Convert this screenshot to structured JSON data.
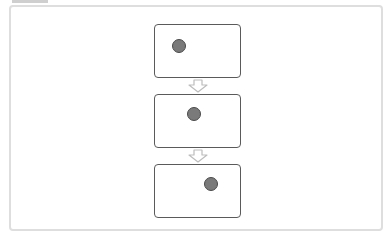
{
  "diagram": {
    "colors": {
      "frame_border": "#dedede",
      "panel_border": "#5a5a5a",
      "dot_fill": "#7a7a7a",
      "dot_border": "#4a4a4a",
      "arrow_stroke": "#bdbdbd"
    },
    "panels": [
      {
        "step": 1,
        "dot_position": "left"
      },
      {
        "step": 2,
        "dot_position": "center"
      },
      {
        "step": 3,
        "dot_position": "right"
      }
    ],
    "arrows": [
      {
        "from": 1,
        "to": 2,
        "icon": "hollow-down-arrow-icon"
      },
      {
        "from": 2,
        "to": 3,
        "icon": "hollow-down-arrow-icon"
      }
    ]
  }
}
